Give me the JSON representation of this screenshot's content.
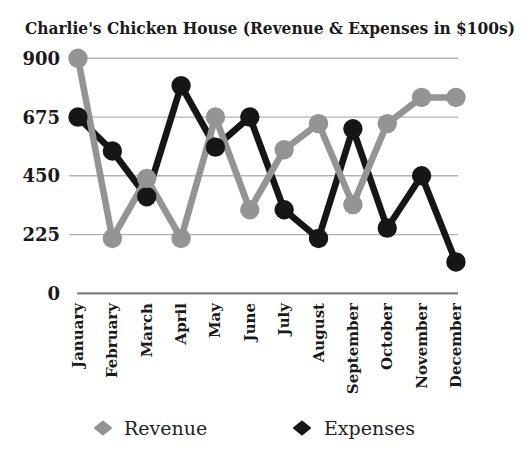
{
  "page": {
    "background": "#ffffff"
  },
  "chart_data": {
    "type": "line",
    "title": "Charlie's Chicken House (Revenue & Expenses in $100s)",
    "units": "$100s",
    "categories": [
      "January",
      "February",
      "March",
      "April",
      "May",
      "June",
      "July",
      "August",
      "September",
      "October",
      "November",
      "December"
    ],
    "series": [
      {
        "name": "Revenue",
        "color": "#949494",
        "values": [
          900,
          210,
          440,
          210,
          675,
          320,
          550,
          650,
          340,
          650,
          750,
          750
        ]
      },
      {
        "name": "Expenses",
        "color": "#161616",
        "values": [
          675,
          545,
          370,
          795,
          560,
          675,
          320,
          210,
          630,
          250,
          450,
          120
        ]
      }
    ],
    "yticks": [
      900,
      675,
      450,
      225,
      0
    ],
    "ylim": [
      0,
      960
    ],
    "grid": true,
    "legend_position": "bottom",
    "gridline_color": "#b3b3b3",
    "axis_line_color": "#7f7f7f"
  }
}
